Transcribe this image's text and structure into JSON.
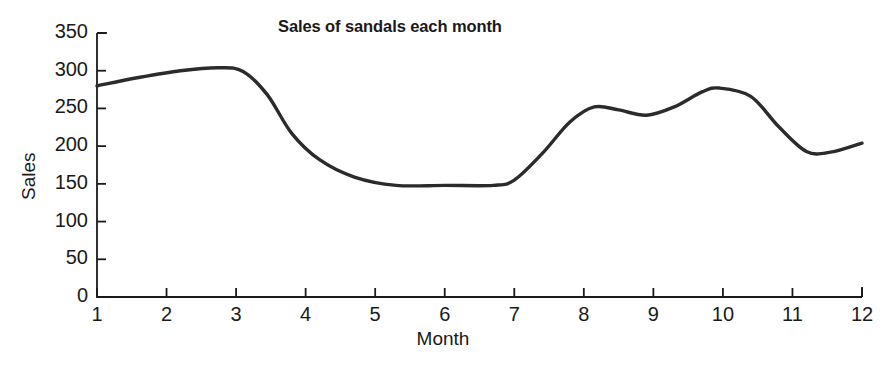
{
  "chart_data": {
    "type": "line",
    "title": "Sales of sandals each month",
    "xlabel": "Month",
    "ylabel": "Sales",
    "xlim": [
      1,
      12
    ],
    "ylim": [
      0,
      350
    ],
    "grid": false,
    "legend": "none",
    "line_color": "#2b2b2b",
    "x_ticks": [
      "1",
      "2",
      "3",
      "4",
      "5",
      "6",
      "7",
      "8",
      "9",
      "10",
      "11",
      "12"
    ],
    "y_ticks": [
      "0",
      "50",
      "100",
      "150",
      "200",
      "250",
      "300",
      "350"
    ],
    "x": [
      1,
      2,
      3,
      4,
      5,
      6,
      7,
      8,
      9,
      10,
      11,
      12
    ],
    "values": [
      280,
      300,
      303,
      185,
      150,
      148,
      152,
      250,
      241,
      276,
      192,
      204
    ],
    "series": [
      {
        "name": "Sales",
        "values": [
          280,
          300,
          303,
          185,
          150,
          148,
          152,
          250,
          241,
          276,
          192,
          204
        ]
      }
    ],
    "control_points": [
      {
        "x": 1.0,
        "y": 280
      },
      {
        "x": 1.6,
        "y": 291
      },
      {
        "x": 2.2,
        "y": 300
      },
      {
        "x": 2.75,
        "y": 304
      },
      {
        "x": 3.1,
        "y": 299
      },
      {
        "x": 3.45,
        "y": 268
      },
      {
        "x": 3.8,
        "y": 217
      },
      {
        "x": 4.2,
        "y": 182
      },
      {
        "x": 4.7,
        "y": 159
      },
      {
        "x": 5.3,
        "y": 148
      },
      {
        "x": 6.0,
        "y": 148
      },
      {
        "x": 6.7,
        "y": 148
      },
      {
        "x": 7.0,
        "y": 155
      },
      {
        "x": 7.4,
        "y": 190
      },
      {
        "x": 7.8,
        "y": 232
      },
      {
        "x": 8.15,
        "y": 252
      },
      {
        "x": 8.5,
        "y": 248
      },
      {
        "x": 8.9,
        "y": 241
      },
      {
        "x": 9.3,
        "y": 252
      },
      {
        "x": 9.7,
        "y": 272
      },
      {
        "x": 9.95,
        "y": 277
      },
      {
        "x": 10.4,
        "y": 266
      },
      {
        "x": 10.8,
        "y": 226
      },
      {
        "x": 11.2,
        "y": 193
      },
      {
        "x": 11.55,
        "y": 192
      },
      {
        "x": 12.0,
        "y": 204
      }
    ]
  },
  "caption": {
    "text": ""
  }
}
